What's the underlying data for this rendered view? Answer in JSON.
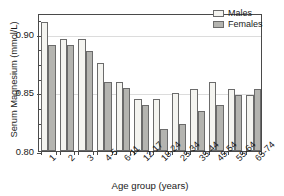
{
  "chart_data": {
    "type": "bar",
    "title": "",
    "xlabel": "Age group (years)",
    "ylabel": "Serum Magnesium (mmol/L)",
    "categories": [
      "1",
      "2",
      "3",
      "4-5",
      "6-11",
      "12-17",
      "18-24",
      "25-34",
      "35-44",
      "45-54",
      "55-64",
      "65-74"
    ],
    "series": [
      {
        "name": "Males",
        "color": "#f4f4f0",
        "values": [
          0.91,
          0.895,
          0.895,
          0.875,
          0.859,
          0.844,
          0.844,
          0.849,
          0.853,
          0.859,
          0.853,
          0.848
        ]
      },
      {
        "name": "Females",
        "color": "#b4b4b0",
        "values": [
          0.89,
          0.89,
          0.885,
          0.859,
          0.854,
          0.839,
          0.819,
          0.823,
          0.834,
          0.839,
          0.848,
          0.853
        ]
      }
    ],
    "ylim": [
      0.8,
      0.9175
    ],
    "ytick_labels": [
      "0.80",
      "0.85",
      "0.90"
    ],
    "ytick_values": [
      0.8,
      0.85,
      0.9
    ],
    "yminor_values": [
      0.8125,
      0.825,
      0.8375,
      0.8625,
      0.875,
      0.8875,
      0.9125
    ],
    "grid": true,
    "grid_axis": "y",
    "legend_position": "top-right"
  }
}
